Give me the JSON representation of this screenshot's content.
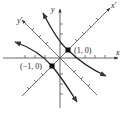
{
  "diagram": {
    "type": "rotated-axes-hyperbola",
    "axes": {
      "x_label": "x",
      "y_label": "y",
      "x_prime_label": "x'",
      "y_prime_label": "y'"
    },
    "points": [
      {
        "label": "(1, 0)",
        "coord": [
          1,
          0
        ]
      },
      {
        "label": "(−1, 0)",
        "coord": [
          -1,
          0
        ]
      }
    ],
    "colors": {
      "stroke": "#333333",
      "background": "#ffffff"
    }
  }
}
